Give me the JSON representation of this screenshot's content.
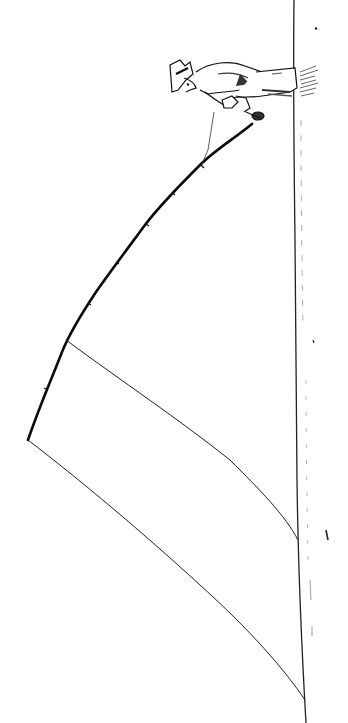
{
  "illustration": {
    "subject": "Fisherman with bent fishing rod, line drawing (rotated)",
    "caption": "",
    "colors": {
      "background": "#ffffff",
      "ink": "#111111",
      "shadow": "#555555"
    },
    "elements": [
      "fisherman",
      "fishing-rod",
      "fishing-line-inner",
      "fishing-line-outer",
      "ground-line",
      "reel"
    ]
  }
}
